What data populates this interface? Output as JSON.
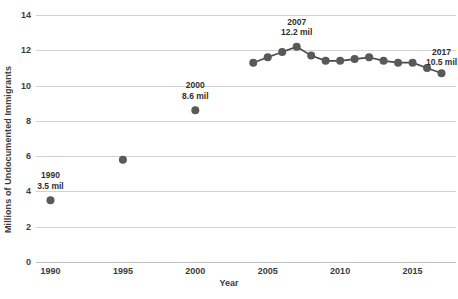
{
  "chart_data": {
    "type": "line",
    "title": "",
    "xlabel": "Year",
    "ylabel": "Millions of Undocumented Immigrants",
    "xlim": [
      1989,
      2018
    ],
    "ylim": [
      0,
      14
    ],
    "grid": true,
    "legend": "none",
    "marker_color": "#595959",
    "line_color": "#4a4a4a",
    "gridline_color": "#d2d2d2",
    "y_ticks": [
      0,
      2,
      4,
      6,
      8,
      10,
      12,
      14
    ],
    "y_tick_labels": [
      "0",
      "2",
      "4",
      "6",
      "8",
      "10",
      "12",
      "14"
    ],
    "x_ticks": [
      1990,
      1995,
      2000,
      2005,
      2010,
      2015
    ],
    "x_tick_labels": [
      "1990",
      "1995",
      "2000",
      "2005",
      "2010",
      "2015"
    ],
    "series": [
      {
        "name": "Undocumented immigrants (isolated estimates)",
        "mode": "markers",
        "x": [
          1990,
          1995,
          2000
        ],
        "values": [
          3.5,
          5.8,
          8.6
        ]
      },
      {
        "name": "Undocumented immigrants (annual estimates)",
        "mode": "lines+markers",
        "x": [
          2004,
          2005,
          2006,
          2007,
          2008,
          2009,
          2010,
          2011,
          2012,
          2013,
          2014,
          2015,
          2016,
          2017
        ],
        "values": [
          11.3,
          11.6,
          11.9,
          12.2,
          11.7,
          11.4,
          11.4,
          11.5,
          11.6,
          11.4,
          11.3,
          11.3,
          11.0,
          10.7
        ]
      }
    ],
    "annotations": [
      {
        "x": 1990,
        "y": 3.5,
        "year_label": "1990",
        "value_label": "3.5 mil"
      },
      {
        "x": 2000,
        "y": 8.6,
        "year_label": "2000",
        "value_label": "8.6 mil"
      },
      {
        "x": 2007,
        "y": 12.2,
        "year_label": "2007",
        "value_label": "12.2 mil"
      },
      {
        "x": 2017,
        "y": 10.5,
        "year_label": "2017",
        "value_label": "10.5 mil"
      }
    ]
  }
}
